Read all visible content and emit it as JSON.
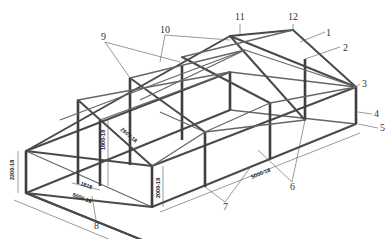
{
  "diagram": {
    "callouts": [
      {
        "id": "1",
        "label": "1",
        "x": 326,
        "y": 36
      },
      {
        "id": "2",
        "label": "2",
        "x": 343,
        "y": 51
      },
      {
        "id": "3",
        "label": "3",
        "x": 362,
        "y": 87
      },
      {
        "id": "4",
        "label": "4",
        "x": 374,
        "y": 117
      },
      {
        "id": "5",
        "label": "5",
        "x": 380,
        "y": 131
      },
      {
        "id": "6",
        "label": "6",
        "x": 290,
        "y": 187
      },
      {
        "id": "7",
        "label": "7",
        "x": 223,
        "y": 207
      },
      {
        "id": "8",
        "label": "8",
        "x": 94,
        "y": 226
      },
      {
        "id": "9",
        "label": "9",
        "x": 101,
        "y": 40
      },
      {
        "id": "10",
        "label": "10",
        "x": 160,
        "y": 33
      },
      {
        "id": "11",
        "label": "11",
        "x": 235,
        "y": 20
      },
      {
        "id": "12",
        "label": "12",
        "x": 288,
        "y": 20
      }
    ],
    "dimensions": [
      {
        "id": "height-left",
        "label": "2200-18"
      },
      {
        "id": "door-height",
        "label": "1800-18"
      },
      {
        "id": "rafter",
        "label": "2907-18"
      },
      {
        "id": "bay-width",
        "label": "1818"
      },
      {
        "id": "width",
        "label": "5000-18"
      },
      {
        "id": "post-height",
        "label": "2000-18"
      },
      {
        "id": "length",
        "label": "5000-18"
      }
    ]
  }
}
